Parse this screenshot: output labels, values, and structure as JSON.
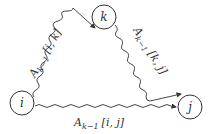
{
  "diagram": {
    "nodes": [
      {
        "id": "i",
        "label": "i"
      },
      {
        "id": "k",
        "label": "k"
      },
      {
        "id": "j",
        "label": "j"
      }
    ],
    "edges": [
      {
        "from": "i",
        "to": "k",
        "label_main": "A",
        "label_sub": "k−1",
        "label_args": "[i, k]"
      },
      {
        "from": "k",
        "to": "j",
        "label_main": "A",
        "label_sub": "k−1",
        "label_args": "[k, j]"
      },
      {
        "from": "i",
        "to": "j",
        "label_main": "A",
        "label_sub": "k−1",
        "label_args": "[i, j]"
      }
    ],
    "colors": {
      "stroke": "#333333",
      "background": "#ffffff"
    }
  }
}
